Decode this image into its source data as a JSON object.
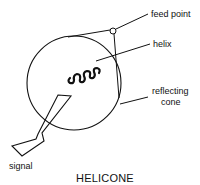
{
  "diagram": {
    "title": "HELICONE",
    "labels": {
      "feed_point": "feed point",
      "helix": "helix",
      "reflecting_cone_line1": "reflecting",
      "reflecting_cone_line2": "cone",
      "signal": "signal"
    },
    "colors": {
      "stroke": "#111111",
      "background": "#ffffff"
    }
  }
}
